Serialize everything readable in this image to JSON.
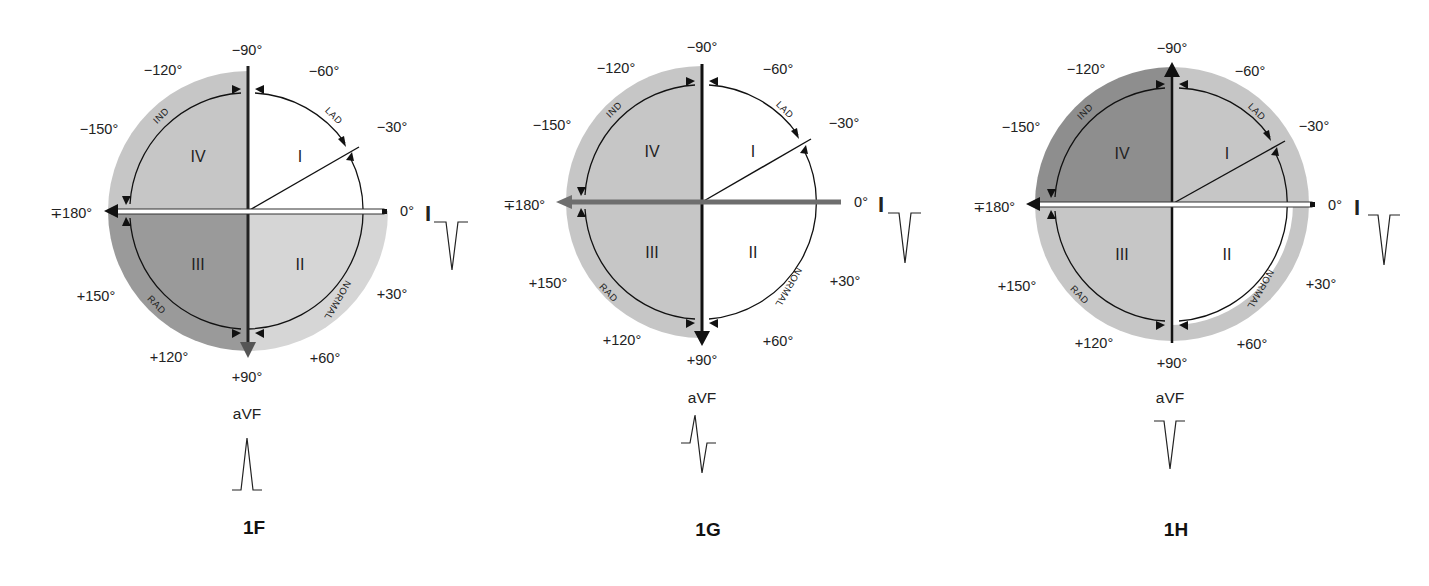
{
  "figure": {
    "axis_labels": {
      "m90": "−90°",
      "m120": "−120°",
      "m60": "−60°",
      "m150": "−150°",
      "m30": "−30°",
      "pm180": "∓180°",
      "zero": "0°",
      "p150": "+150°",
      "p30": "+30°",
      "p120": "+120°",
      "p60": "+60°",
      "p90": "+90°"
    },
    "quadrants": {
      "I": "I",
      "II": "II",
      "III": "III",
      "IV": "IV"
    },
    "arc_labels": {
      "lad": "LAD",
      "ind": "IND",
      "rad": "RAD",
      "normal": "NORMAL"
    },
    "leads": {
      "lead_i": "I",
      "lead_avf": "aVF"
    }
  },
  "panels": [
    {
      "id": "1F",
      "title": "1F",
      "colors": {
        "q1": "#ffffff",
        "q2": "#d6d6d6",
        "q3": "#9a9a9a",
        "q4": "#c6c6c6"
      },
      "lead_i_waveform": "negative",
      "avf_waveform": "positive",
      "resultant_axis": "toward +90° (aVF positive), lead I negative → right axis deviation region (III)"
    },
    {
      "id": "1G",
      "title": "1G",
      "colors": {
        "q1": "#ffffff",
        "q2": "#ffffff",
        "q3": "#c6c6c6",
        "q4": "#c6c6c6"
      },
      "lead_i_waveform": "negative",
      "avf_waveform": "biphasic",
      "resultant_axis": "toward ∓180° (lead I negative, aVF equiphasic)"
    },
    {
      "id": "1H",
      "title": "1H",
      "colors": {
        "q1": "#c6c6c6",
        "q2": "#ffffff",
        "q3": "#c6c6c6",
        "q4": "#8e8e8e"
      },
      "lead_i_waveform": "negative",
      "avf_waveform": "negative",
      "resultant_axis": "toward −90° (aVF negative), lead I negative → indeterminate axis region (IV)"
    }
  ]
}
